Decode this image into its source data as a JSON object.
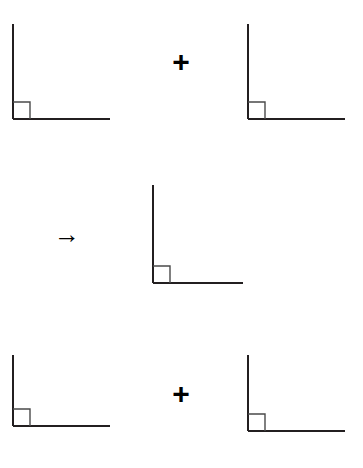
{
  "diagram": {
    "background_color": "#ffffff",
    "stroke_color": "#231f20",
    "marker_color": "#4a4a4a",
    "width": 363,
    "height": 468,
    "figures": [
      {
        "id": "top-left-right-angle",
        "label": "right-angle-figure-top-left",
        "angle_degrees": 90,
        "vertex_x": 13,
        "vertex_y": 119,
        "vertical_ray_length": 95,
        "horizontal_ray_length": 97,
        "marker_size": 17,
        "stroke_width": 2
      },
      {
        "id": "top-right-right-angle",
        "label": "right-angle-figure-top-right",
        "angle_degrees": 90,
        "vertex_x": 248,
        "vertex_y": 119,
        "vertical_ray_length": 95,
        "horizontal_ray_length": 97,
        "marker_size": 17,
        "stroke_width": 2
      },
      {
        "id": "middle-right-angle",
        "label": "right-angle-figure-result",
        "angle_degrees": 90,
        "vertex_x": 153,
        "vertex_y": 283,
        "vertical_ray_length": 98,
        "horizontal_ray_length": 90,
        "marker_size": 17,
        "stroke_width": 2
      },
      {
        "id": "bottom-left-right-angle",
        "label": "right-angle-figure-bottom-left",
        "angle_degrees": 90,
        "vertex_x": 13,
        "vertex_y": 426,
        "vertical_ray_length": 71,
        "horizontal_ray_length": 97,
        "marker_size": 17,
        "stroke_width": 2
      },
      {
        "id": "bottom-right-right-angle",
        "label": "right-angle-figure-bottom-right",
        "angle_degrees": 90,
        "vertex_x": 248,
        "vertex_y": 431,
        "vertical_ray_length": 76,
        "horizontal_ray_length": 97,
        "marker_size": 17,
        "stroke_width": 2
      }
    ],
    "operators": [
      {
        "id": "plus-top",
        "glyph": "+",
        "name": "plus-sign",
        "center_x": 181,
        "center_y": 62
      },
      {
        "id": "arrow-middle",
        "glyph": "→",
        "name": "right-arrow",
        "center_x": 67,
        "center_y": 235
      },
      {
        "id": "plus-bottom",
        "glyph": "+",
        "name": "plus-sign",
        "center_x": 181,
        "center_y": 394
      }
    ]
  }
}
